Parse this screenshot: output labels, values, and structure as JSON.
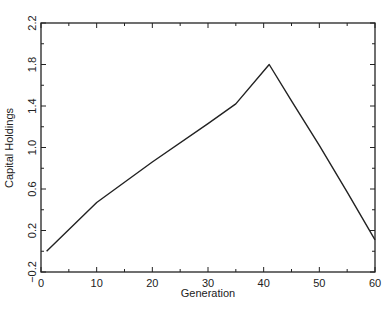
{
  "chart_data": {
    "type": "line",
    "title": "",
    "xlabel": "Generation",
    "ylabel": "Capital Holdings",
    "xlim": [
      0,
      60
    ],
    "ylim": [
      -0.2,
      2.2
    ],
    "xticks": [
      0,
      10,
      20,
      30,
      40,
      50,
      60
    ],
    "xtick_labels": [
      "0",
      "10",
      "20",
      "30",
      "40",
      "50",
      "60"
    ],
    "xminor_step": 5,
    "yticks": [
      -0.2,
      0.2,
      0.6,
      1.0,
      1.4,
      1.8,
      2.2
    ],
    "ytick_labels": [
      "−0.2",
      "0.2",
      "0.6",
      "1.0",
      "1.4",
      "1.8",
      "2.2"
    ],
    "yminor_step": 0.2,
    "grid": false,
    "legend": null,
    "series": [
      {
        "name": "Capital Holdings",
        "color": "#222222",
        "x": [
          1,
          10,
          20,
          30,
          35,
          41,
          45,
          50,
          55,
          60
        ],
        "y": [
          0.0,
          0.47,
          0.86,
          1.23,
          1.42,
          1.8,
          1.45,
          1.02,
          0.57,
          0.11
        ]
      }
    ]
  }
}
